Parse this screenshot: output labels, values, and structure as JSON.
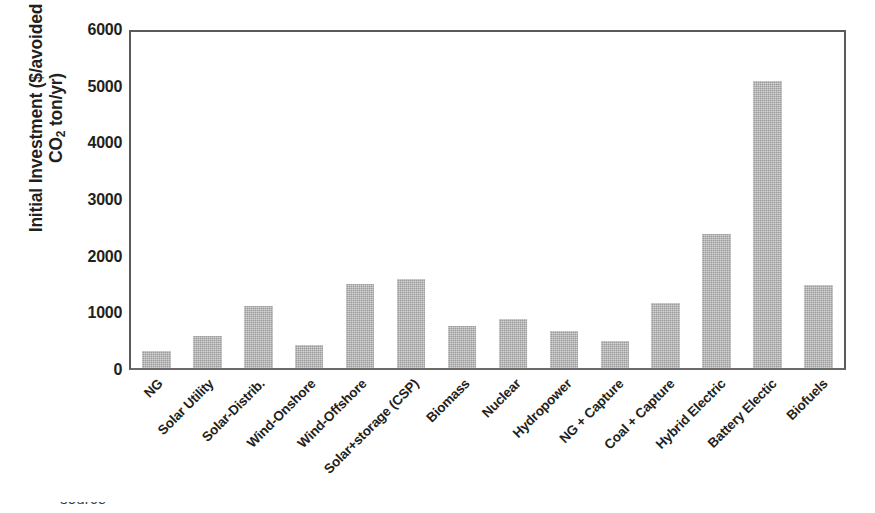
{
  "chart_data": {
    "type": "bar",
    "title": "",
    "xlabel": "",
    "ylabel": "Initial Investment ($/avoided CO2 ton/yr)",
    "ylabel_line1": "Initial Investment ($/avoided",
    "ylabel_line2_pre": "CO",
    "ylabel_line2_sub": "2",
    "ylabel_line2_post": " ton/yr)",
    "ylim": [
      0,
      6000
    ],
    "ytick_values": [
      0,
      1000,
      2000,
      3000,
      4000,
      5000,
      6000
    ],
    "ytick_labels": [
      "0",
      "1000",
      "2000",
      "3000",
      "4000",
      "5000",
      "6000"
    ],
    "grid": false,
    "legend": "none",
    "bar_color": "#9a9a9a",
    "axis_color": "#5a5a5a",
    "categories": [
      "NG",
      "Solar Utility",
      "Solar-Distrib.",
      "Wind-Onshore",
      "Wind-Offshore",
      "Solar+storage (CSP)",
      "Biomass",
      "Nuclear",
      "Hydropower",
      "NG + Capture",
      "Coal + Capture",
      "Hybrid Electric",
      "Battery Electic",
      "Biofuels"
    ],
    "values": [
      300,
      570,
      1090,
      400,
      1480,
      1570,
      750,
      860,
      660,
      470,
      1150,
      2370,
      5070,
      1460
    ]
  },
  "caption": {
    "text": "source"
  }
}
